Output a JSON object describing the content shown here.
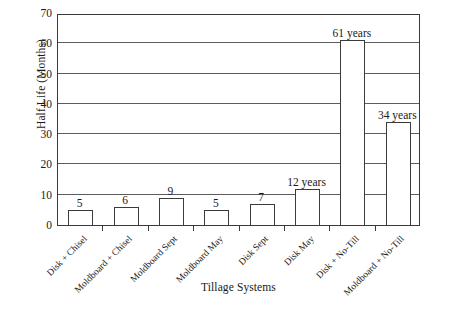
{
  "chart_data": {
    "type": "bar",
    "title": "",
    "xlabel": "Tillage Systems",
    "ylabel": "Half Life (Months)",
    "ylim": [
      0,
      70
    ],
    "ytick_labels": [
      "0",
      "10",
      "20",
      "30",
      "40",
      "50",
      "60",
      "70"
    ],
    "ytick_values": [
      0,
      10,
      20,
      30,
      40,
      50,
      60,
      70
    ],
    "grid": true,
    "legend": "none",
    "categories": [
      "Disk + Chisel",
      "Moldboard + Chisel",
      "Moldboard Sept",
      "Moldboard May",
      "Disk Sept",
      "Disk May",
      "Disk + No-Till",
      "Moldboard + No-Till"
    ],
    "values": [
      5,
      6,
      9,
      5,
      7,
      12,
      61,
      34
    ],
    "data_labels": [
      "5",
      "6",
      "9",
      "5",
      "7",
      "12 years",
      "61 years",
      "34 years"
    ],
    "bar_fill_color": "#ffffff",
    "bar_edge_color": "#3b3b3b",
    "grid_color": "#5c5c5c",
    "frame_color": "#3a3a3a"
  }
}
